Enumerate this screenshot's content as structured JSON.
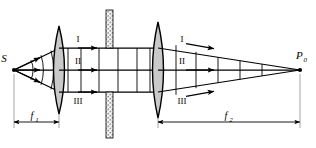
{
  "figure": {
    "background_color": "#ffffff",
    "line_color": "#000000",
    "lens_fill_color": "#c9c9c9",
    "barrier_fill_color": "#9a9a9a",
    "width": 316,
    "height": 148
  },
  "labels": {
    "source_point": "S",
    "image_point_letter": "P",
    "image_point_subscript": "0",
    "focal_length_1_letter": "f",
    "focal_length_1_subscript": "1",
    "focal_length_2_letter": "f",
    "focal_length_2_subscript": "2",
    "zone_top_left": "I",
    "zone_middle_left": "II",
    "zone_bottom_left": "III",
    "zone_top_right": "I",
    "zone_middle_right": "II",
    "zone_bottom_right": "III"
  },
  "components": {
    "lens_1_name": "converging-lens-1",
    "lens_2_name": "converging-lens-2",
    "barrier_name": "aperture-stop-barrier",
    "axis_name": "optical-axis"
  },
  "geometry": {
    "source_x": 14,
    "source_y": 70,
    "image_x": 300,
    "image_y": 70,
    "lens_1_x": 59,
    "lens_2_x": 158,
    "barrier_x": 110,
    "axis_y": 70,
    "beam_half_height": 22,
    "f1_span": [
      14,
      59
    ],
    "f2_span": [
      158,
      300
    ],
    "dim_line_y": 122
  }
}
